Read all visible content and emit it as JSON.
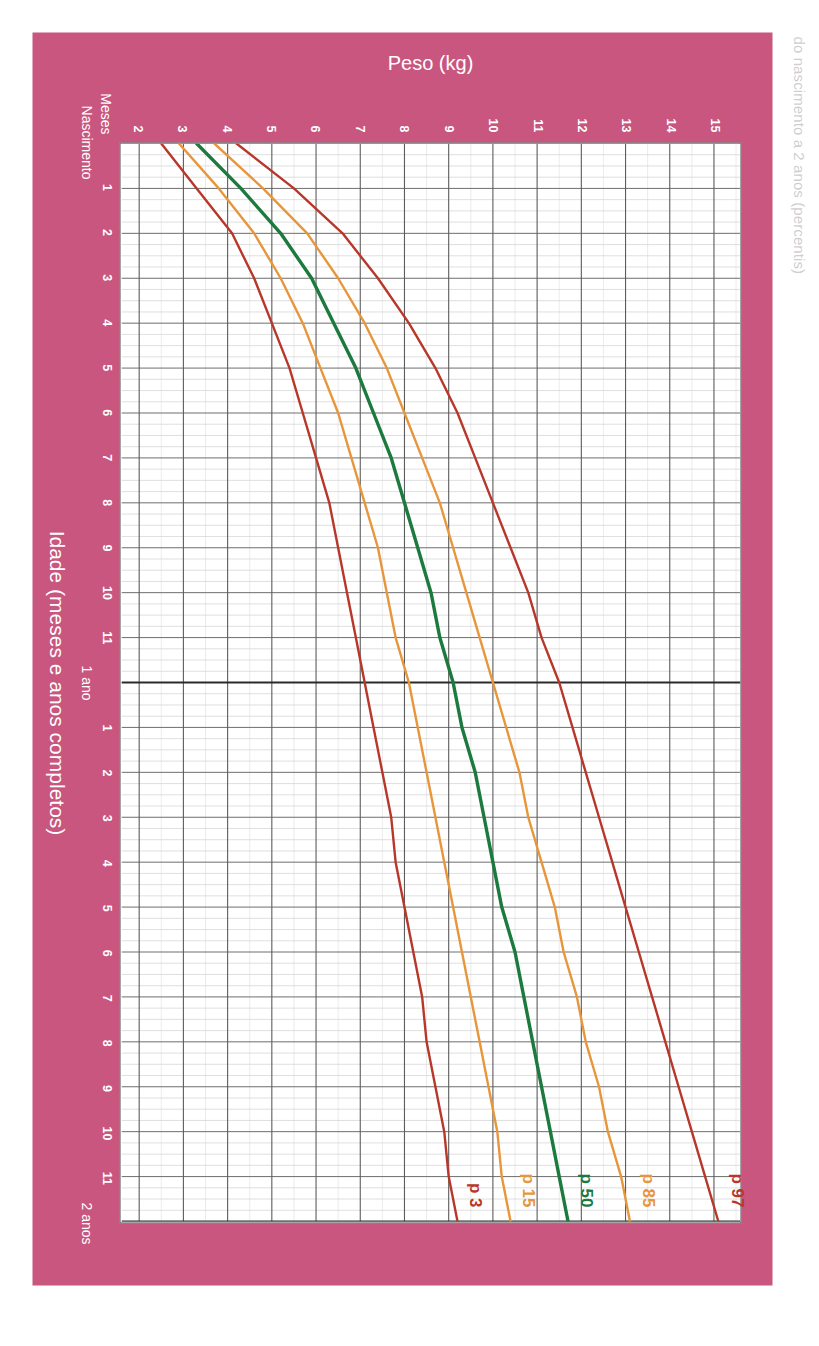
{
  "document": {
    "title": "do nascimento a 2 anos (percentis)",
    "panel_color": "#c8567e",
    "plot_background": "#ffffff"
  },
  "axes": {
    "x": {
      "title": "Idade (meses e anos completos)",
      "origin_label": "Nascimento",
      "unit_label": "Meses",
      "year_labels": [
        {
          "value": 12,
          "label": "1 ano"
        },
        {
          "value": 24,
          "label": "2 anos"
        }
      ],
      "ticks": [
        {
          "value": 1,
          "label": "1"
        },
        {
          "value": 2,
          "label": "2"
        },
        {
          "value": 3,
          "label": "3"
        },
        {
          "value": 4,
          "label": "4"
        },
        {
          "value": 5,
          "label": "5"
        },
        {
          "value": 6,
          "label": "6"
        },
        {
          "value": 7,
          "label": "7"
        },
        {
          "value": 8,
          "label": "8"
        },
        {
          "value": 9,
          "label": "9"
        },
        {
          "value": 10,
          "label": "10"
        },
        {
          "value": 11,
          "label": "11"
        },
        {
          "value": 13,
          "label": "1"
        },
        {
          "value": 14,
          "label": "2"
        },
        {
          "value": 15,
          "label": "3"
        },
        {
          "value": 16,
          "label": "4"
        },
        {
          "value": 17,
          "label": "5"
        },
        {
          "value": 18,
          "label": "6"
        },
        {
          "value": 19,
          "label": "7"
        },
        {
          "value": 20,
          "label": "8"
        },
        {
          "value": 21,
          "label": "9"
        },
        {
          "value": 22,
          "label": "10"
        },
        {
          "value": 23,
          "label": "11"
        }
      ],
      "min": 0,
      "max": 24
    },
    "y": {
      "title": "Peso (kg)",
      "ticks": [
        {
          "value": 2,
          "label": "2"
        },
        {
          "value": 3,
          "label": "3"
        },
        {
          "value": 4,
          "label": "4"
        },
        {
          "value": 5,
          "label": "5"
        },
        {
          "value": 6,
          "label": "6"
        },
        {
          "value": 7,
          "label": "7"
        },
        {
          "value": 8,
          "label": "8"
        },
        {
          "value": 9,
          "label": "9"
        },
        {
          "value": 10,
          "label": "10"
        },
        {
          "value": 11,
          "label": "11"
        },
        {
          "value": 12,
          "label": "12"
        },
        {
          "value": 13,
          "label": "13"
        },
        {
          "value": 14,
          "label": "14"
        },
        {
          "value": 15,
          "label": "15"
        }
      ],
      "min": 1.6,
      "max": 15.6
    }
  },
  "curve_labels": [
    {
      "name": "p97",
      "text": "p 97",
      "color": "#b8372b"
    },
    {
      "name": "p85",
      "text": "p 85",
      "color": "#e8963c"
    },
    {
      "name": "p50",
      "text": "p 50",
      "color": "#1d7a3e"
    },
    {
      "name": "p15",
      "text": "p 15",
      "color": "#e8963c"
    },
    {
      "name": "p3",
      "text": "p 3",
      "color": "#b8372b"
    }
  ],
  "chart_data": {
    "type": "line",
    "title": "do nascimento a 2 anos (percentis)",
    "xlabel": "Idade (meses e anos completos)",
    "ylabel": "Peso (kg)",
    "xlim": [
      0,
      24
    ],
    "ylim": [
      1.6,
      15.6
    ],
    "grid": true,
    "legend": "inline-curve-labels-at-top",
    "x": [
      0,
      1,
      2,
      3,
      4,
      5,
      6,
      7,
      8,
      9,
      10,
      11,
      12,
      13,
      14,
      15,
      16,
      17,
      18,
      19,
      20,
      21,
      22,
      23,
      24
    ],
    "series": [
      {
        "name": "p 97",
        "color": "#b8372b",
        "values": [
          4.2,
          5.5,
          6.6,
          7.4,
          8.1,
          8.7,
          9.2,
          9.6,
          10.0,
          10.4,
          10.8,
          11.1,
          11.5,
          11.8,
          12.1,
          12.4,
          12.7,
          13.0,
          13.3,
          13.6,
          13.9,
          14.2,
          14.5,
          14.8,
          15.1
        ]
      },
      {
        "name": "p 85",
        "color": "#e8963c",
        "values": [
          3.7,
          4.8,
          5.8,
          6.5,
          7.1,
          7.6,
          8.0,
          8.4,
          8.8,
          9.1,
          9.4,
          9.7,
          10.0,
          10.3,
          10.6,
          10.8,
          11.1,
          11.4,
          11.6,
          11.9,
          12.1,
          12.4,
          12.6,
          12.9,
          13.1
        ]
      },
      {
        "name": "p 50",
        "color": "#1d7a3e",
        "values": [
          3.3,
          4.3,
          5.2,
          5.9,
          6.4,
          6.9,
          7.3,
          7.7,
          8.0,
          8.3,
          8.6,
          8.8,
          9.1,
          9.3,
          9.6,
          9.8,
          10.0,
          10.2,
          10.5,
          10.7,
          10.9,
          11.1,
          11.3,
          11.5,
          11.7
        ]
      },
      {
        "name": "p 15",
        "color": "#e8963c",
        "values": [
          2.9,
          3.8,
          4.6,
          5.2,
          5.7,
          6.1,
          6.5,
          6.8,
          7.1,
          7.4,
          7.6,
          7.8,
          8.1,
          8.3,
          8.5,
          8.7,
          8.9,
          9.1,
          9.3,
          9.5,
          9.7,
          9.9,
          10.1,
          10.2,
          10.4
        ]
      },
      {
        "name": "p 3",
        "color": "#b8372b",
        "values": [
          2.5,
          3.3,
          4.1,
          4.6,
          5.0,
          5.4,
          5.7,
          6.0,
          6.3,
          6.5,
          6.7,
          6.9,
          7.1,
          7.3,
          7.5,
          7.7,
          7.8,
          8.0,
          8.2,
          8.4,
          8.5,
          8.7,
          8.9,
          9.0,
          9.2
        ]
      }
    ]
  }
}
